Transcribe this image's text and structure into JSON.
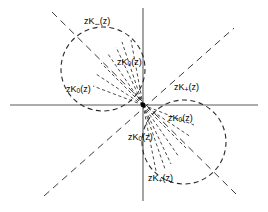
{
  "figure": {
    "background_color": "#ffffff",
    "stroke_color": "#000000",
    "axis_color": "#555555",
    "width": 268,
    "height": 212
  },
  "axes": {
    "origin": {
      "x": 143,
      "y": 105
    },
    "horizontal": {
      "x1": 10,
      "y1": 105,
      "x2": 258,
      "y2": 105
    },
    "vertical": {
      "x1": 143,
      "y1": 8,
      "x2": 143,
      "y2": 201
    }
  },
  "diagonals": [
    {
      "name": "diagonal-upper-left-to-lower-right",
      "x1": 52,
      "y1": 12,
      "x2": 236,
      "y2": 194
    },
    {
      "name": "diagonal-lower-left-to-upper-right",
      "x1": 44,
      "y1": 196,
      "x2": 234,
      "y2": 28
    }
  ],
  "circles": [
    {
      "name": "circle-upper-left",
      "cx": 103,
      "cy": 69,
      "r": 42
    },
    {
      "name": "circle-lower-right",
      "cx": 184,
      "cy": 142,
      "r": 42
    }
  ],
  "rays": {
    "description": "dashed radial rays fanning out from the origin",
    "count": 14
  },
  "labels": [
    {
      "id": "label-zk-minus-top",
      "base": "zK",
      "sub": "−",
      "sub_kind": "minus",
      "tail": "(z)",
      "text": "zK−(z)",
      "x": 84,
      "y": 17
    },
    {
      "id": "label-zk-zero-upper-inner",
      "base": "zK",
      "sub": "0",
      "sub_kind": "zero",
      "tail": "(z)",
      "text": "zK0(z)",
      "x": 117,
      "y": 58
    },
    {
      "id": "label-zk-zero-left",
      "base": "zK",
      "sub": "0",
      "sub_kind": "zero",
      "tail": "(z)",
      "text": "zK0(z)",
      "x": 66,
      "y": 85
    },
    {
      "id": "label-zk-plus-right",
      "base": "zK",
      "sub": "+",
      "sub_kind": "plus",
      "tail": "(z)",
      "text": "zK+(z)",
      "x": 174,
      "y": 83
    },
    {
      "id": "label-zk-zero-lower-inner",
      "base": "zK",
      "sub": "0",
      "sub_kind": "zero",
      "tail": "(z)",
      "text": "zK0(z)",
      "x": 168,
      "y": 114
    },
    {
      "id": "label-zk-zero-lower-center",
      "base": "zK",
      "sub": "0",
      "sub_kind": "zero",
      "tail": "(z)",
      "text": "zK0(z)",
      "x": 128,
      "y": 133
    },
    {
      "id": "label-zk-plus-bottom",
      "base": "zK",
      "sub": "+",
      "sub_kind": "plus",
      "tail": "(z)",
      "text": "zK+(z)",
      "x": 148,
      "y": 174
    }
  ]
}
